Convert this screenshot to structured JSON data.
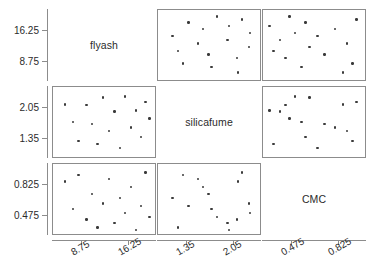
{
  "chart_data": {
    "type": "scatter",
    "title": "",
    "subtitle": "",
    "plot_kind": "scatter-plot-matrix",
    "variables": [
      "flyash",
      "silicafume",
      "CMC"
    ],
    "axes": {
      "flyash": {
        "label": "flyash",
        "ticks": [
          8.75,
          16.25
        ],
        "tick_labels": [
          "8.75",
          "16.25"
        ],
        "range": [
          5.0,
          20.0
        ]
      },
      "silicafume": {
        "label": "silicafume",
        "ticks": [
          1.35,
          2.05
        ],
        "tick_labels": [
          "1.35",
          "2.05"
        ],
        "range": [
          1.0,
          2.4
        ]
      },
      "CMC": {
        "label": "CMC",
        "ticks": [
          0.475,
          0.825
        ],
        "tick_labels": [
          "0.475",
          "0.825"
        ],
        "range": [
          0.3,
          1.0
        ]
      }
    },
    "grid": false,
    "legend": null,
    "n_points": 16,
    "points": [
      {
        "flyash": 6.1,
        "silicafume": 2.12,
        "CMC": 0.86
      },
      {
        "flyash": 7.35,
        "silicafume": 1.72,
        "CMC": 0.55
      },
      {
        "flyash": 8.3,
        "silicafume": 1.3,
        "CMC": 0.93
      },
      {
        "flyash": 9.55,
        "silicafume": 2.1,
        "CMC": 0.43
      },
      {
        "flyash": 10.4,
        "silicafume": 1.68,
        "CMC": 0.72
      },
      {
        "flyash": 11.3,
        "silicafume": 1.22,
        "CMC": 0.34
      },
      {
        "flyash": 12.2,
        "silicafume": 2.28,
        "CMC": 0.61
      },
      {
        "flyash": 13.1,
        "silicafume": 1.52,
        "CMC": 0.89
      },
      {
        "flyash": 14.0,
        "silicafume": 1.96,
        "CMC": 0.39
      },
      {
        "flyash": 14.9,
        "silicafume": 1.14,
        "CMC": 0.67
      },
      {
        "flyash": 15.7,
        "silicafume": 2.3,
        "CMC": 0.5
      },
      {
        "flyash": 16.6,
        "silicafume": 1.6,
        "CMC": 0.8
      },
      {
        "flyash": 17.4,
        "silicafume": 1.98,
        "CMC": 0.31
      },
      {
        "flyash": 18.2,
        "silicafume": 1.38,
        "CMC": 0.58
      },
      {
        "flyash": 18.95,
        "silicafume": 2.18,
        "CMC": 0.96
      },
      {
        "flyash": 19.6,
        "silicafume": 1.8,
        "CMC": 0.46
      }
    ],
    "panels": [
      {
        "row": 0,
        "col": 0,
        "kind": "diagonal",
        "label": "flyash"
      },
      {
        "row": 0,
        "col": 1,
        "kind": "scatter",
        "x": "silicafume",
        "y": "flyash"
      },
      {
        "row": 0,
        "col": 2,
        "kind": "scatter",
        "x": "CMC",
        "y": "flyash"
      },
      {
        "row": 1,
        "col": 0,
        "kind": "scatter",
        "x": "flyash",
        "y": "silicafume"
      },
      {
        "row": 1,
        "col": 1,
        "kind": "diagonal",
        "label": "silicafume"
      },
      {
        "row": 1,
        "col": 2,
        "kind": "scatter",
        "x": "CMC",
        "y": "silicafume"
      },
      {
        "row": 2,
        "col": 0,
        "kind": "scatter",
        "x": "flyash",
        "y": "CMC"
      },
      {
        "row": 2,
        "col": 1,
        "kind": "scatter",
        "x": "silicafume",
        "y": "CMC"
      },
      {
        "row": 2,
        "col": 2,
        "kind": "diagonal",
        "label": "CMC"
      }
    ],
    "marker": {
      "shape": "circle",
      "color": "#3a3a3a",
      "size": 2.4
    },
    "panel_border_color": "#8c8c8c",
    "background_color": "#ffffff"
  }
}
